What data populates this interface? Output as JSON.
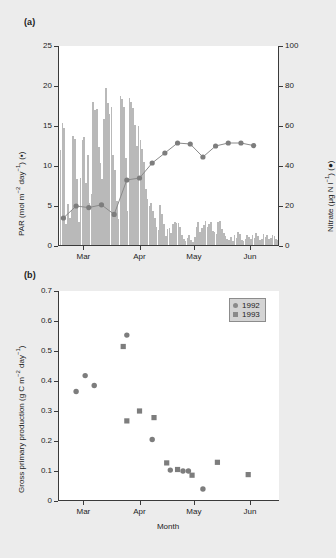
{
  "figure": {
    "panel_a_label": "(a)",
    "panel_b_label": "(b)"
  },
  "chart_data": [
    {
      "id": "panel-a",
      "type": "bar",
      "title": "",
      "xlabel": "",
      "ylabel": "PAR (mol m⁻² day⁻¹) (▪)",
      "ylabel_plain": "PAR (mol m-2 day-1) (square)",
      "y2label": "Nitrate (μg N l⁻¹) (●)",
      "y2label_plain": "Nitrate (ug N l-1) (circle)",
      "ylim": [
        0,
        25
      ],
      "yticks": [
        0,
        5,
        10,
        15,
        20,
        25
      ],
      "yticklabels": [
        "0",
        "5",
        "10",
        "15",
        "20",
        "25"
      ],
      "y2lim": [
        0,
        100
      ],
      "y2ticks": [
        0,
        20,
        40,
        60,
        80,
        100
      ],
      "y2ticklabels": [
        "0",
        "20",
        "40",
        "60",
        "80",
        "100"
      ],
      "xlim": [
        0,
        122
      ],
      "xtick_positions": [
        14,
        45,
        75,
        106
      ],
      "xticklabels": [
        "Mar",
        "Apr",
        "May",
        "Jun"
      ],
      "grid": false,
      "bar_color": "#b9b9b9",
      "line_color": "#8a8a8a",
      "marker_color": "#7d7d7d",
      "series": [
        {
          "name": "PAR",
          "axis": "left",
          "x": [
            1,
            2,
            3,
            4,
            5,
            6,
            7,
            8,
            9,
            10,
            11,
            12,
            13,
            14,
            15,
            16,
            17,
            18,
            19,
            20,
            21,
            22,
            23,
            24,
            25,
            26,
            27,
            28,
            29,
            30,
            31,
            32,
            33,
            34,
            35,
            36,
            37,
            38,
            39,
            40,
            41,
            42,
            43,
            44,
            45,
            46,
            47,
            48,
            49,
            50,
            51,
            52,
            53,
            54,
            55,
            56,
            57,
            58,
            59,
            60,
            61,
            62,
            63,
            64,
            65,
            66,
            67,
            68,
            69,
            70,
            71,
            72,
            73,
            74,
            75,
            76,
            77,
            78,
            79,
            80,
            81,
            82,
            83,
            84,
            85,
            86,
            87,
            88,
            89,
            90,
            91,
            92,
            93,
            94,
            95,
            96,
            97,
            98,
            99,
            100,
            101,
            102,
            103,
            104,
            105,
            106,
            107,
            108,
            109,
            110,
            111,
            112,
            113,
            114,
            115,
            116,
            117,
            118,
            119,
            120,
            121
          ],
          "values": [
            11.9,
            15.2,
            14.6,
            2.6,
            5.1,
            3.4,
            4.4,
            13.6,
            13.3,
            8.2,
            2.9,
            8.4,
            13.1,
            13.5,
            7.8,
            11.3,
            5.3,
            6.4,
            17.9,
            16.9,
            17.0,
            12.2,
            10.3,
            8.3,
            15.7,
            19.6,
            17.8,
            16.4,
            17.2,
            11.3,
            9.4,
            5.5,
            3.2,
            18.6,
            18.3,
            17.3,
            10.9,
            4.3,
            18.4,
            17.9,
            17.1,
            15.0,
            12.4,
            14.9,
            13.1,
            12.0,
            10.4,
            7.0,
            5.8,
            4.9,
            5.3,
            4.2,
            3.4,
            2.2,
            1.9,
            5.0,
            3.9,
            2.6,
            1.1,
            2.0,
            2.1,
            1.5,
            2.6,
            2.9,
            2.7,
            2.8,
            2.3,
            1.2,
            0.8,
            0.5,
            0.9,
            1.3,
            0.6,
            0.4,
            1.0,
            2.3,
            2.9,
            1.6,
            2.1,
            2.5,
            3.0,
            2.2,
            2.6,
            2.9,
            1.8,
            1.6,
            1.4,
            2.9,
            3.0,
            2.0,
            1.5,
            1.1,
            0.7,
            0.6,
            1.0,
            0.5,
            1.3,
            0.9,
            1.6,
            1.4,
            0.6,
            0.5,
            0.8,
            1.2,
            1.0,
            0.7,
            1.3,
            0.9,
            1.5,
            1.1,
            0.6,
            0.8,
            1.4,
            1.0,
            1.2,
            0.7,
            0.9,
            1.3,
            1.1,
            0.8,
            0.6
          ]
        },
        {
          "name": "Nitrate",
          "axis": "right",
          "x": [
            3,
            10,
            17,
            24,
            31,
            38,
            45,
            52,
            59,
            66,
            73,
            80,
            87,
            94,
            101,
            108,
            115,
            121
          ],
          "values": [
            14.0,
            20.0,
            19.2,
            20.6,
            15.8,
            33.0,
            34.0,
            41.5,
            46.5,
            51.5,
            51.0,
            44.5,
            50.0,
            51.5,
            51.5,
            50.2
          ]
        }
      ]
    },
    {
      "id": "panel-b",
      "type": "scatter",
      "title": "",
      "xlabel": "Month",
      "ylabel": "Gross primary production (g C m⁻² day⁻¹)",
      "ylabel_plain": "Gross primary production (g C m-2 day-1)",
      "ylim": [
        0,
        0.7
      ],
      "yticks": [
        0,
        0.1,
        0.2,
        0.3,
        0.4,
        0.5,
        0.6,
        0.7
      ],
      "yticklabels": [
        "0",
        "0.1",
        "0.2",
        "0.3",
        "0.4",
        "0.5",
        "0.6",
        "0.7"
      ],
      "xlim": [
        0,
        122
      ],
      "xtick_positions": [
        14,
        45,
        75,
        106
      ],
      "xticklabels": [
        "Mar",
        "Apr",
        "May",
        "Jun"
      ],
      "grid": false,
      "legend_position": "top-right",
      "marker_color": "#7d7d7d",
      "series": [
        {
          "name": "1992",
          "marker": "circle",
          "x": [
            10,
            15,
            20,
            38,
            52,
            62,
            69,
            72,
            80
          ],
          "values": [
            0.365,
            0.418,
            0.385,
            0.553,
            0.205,
            0.103,
            0.1,
            0.1,
            0.04
          ]
        },
        {
          "name": "1993",
          "marker": "square",
          "x": [
            36,
            38,
            45,
            53,
            60,
            66,
            74,
            88,
            105
          ],
          "values": [
            0.515,
            0.267,
            0.3,
            0.278,
            0.127,
            0.105,
            0.086,
            0.129,
            0.088
          ]
        }
      ]
    }
  ],
  "panel_b_legend": {
    "entries": [
      {
        "label": "1992",
        "marker": "circle"
      },
      {
        "label": "1993",
        "marker": "square"
      }
    ]
  }
}
